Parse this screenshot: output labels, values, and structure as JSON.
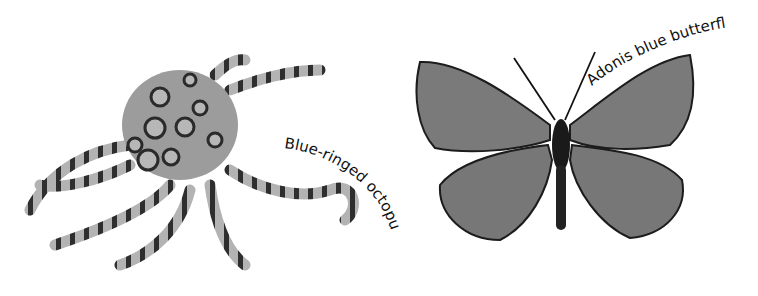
{
  "figures": [
    {
      "name": "octopus",
      "label": "Blue-ringed octopus"
    },
    {
      "name": "butterfly",
      "label": "Adonis blue butterfly"
    }
  ],
  "colors": {
    "background": "#ffffff",
    "body": "#9a9a9a",
    "ring": "#2a2a2a",
    "wing": "#7c7c7c",
    "text": "#111111"
  }
}
